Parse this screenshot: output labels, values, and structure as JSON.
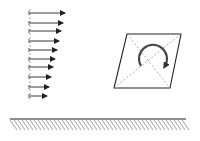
{
  "diagram": {
    "colors": {
      "stroke": "#222222",
      "dashed": "#888888",
      "background": "#ffffff"
    },
    "velocity_profile": {
      "base_x": 30,
      "arrows": [
        {
          "y": 13,
          "length": 35
        },
        {
          "y": 23,
          "length": 33
        },
        {
          "y": 31,
          "length": 31
        },
        {
          "y": 41,
          "length": 29
        },
        {
          "y": 50,
          "length": 27
        },
        {
          "y": 59,
          "length": 25
        },
        {
          "y": 67,
          "length": 23
        },
        {
          "y": 77,
          "length": 21
        },
        {
          "y": 87,
          "length": 19
        },
        {
          "y": 96,
          "length": 17
        }
      ]
    },
    "fluid_element": {
      "shape": "parallelogram",
      "corners": [
        [
          127,
          34
        ],
        [
          181,
          34
        ],
        [
          170,
          88
        ],
        [
          114,
          88
        ]
      ],
      "rotation": "clockwise"
    },
    "wall": {
      "y": 119,
      "x_start": 10,
      "x_end": 186,
      "hatch_spacing": 4,
      "hatch_depth": 11
    }
  }
}
